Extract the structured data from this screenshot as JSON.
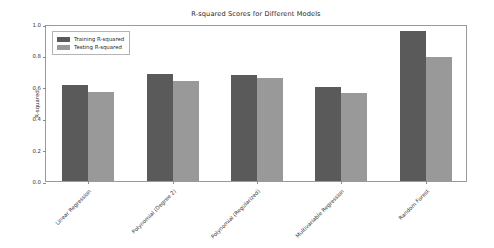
{
  "chart_data": {
    "type": "bar",
    "title": "R-squared Scores for Different Models",
    "xlabel": "",
    "ylabel": "R-squared",
    "categories": [
      "Linear Regression",
      "Polynomial (Degree 2)",
      "Polynomial (Regularized)",
      "Multivariable Regression",
      "Random Forest"
    ],
    "series": [
      {
        "name": "Training R-squared",
        "color": "#5a5a5a",
        "values": [
          0.61,
          0.68,
          0.675,
          0.6,
          0.955
        ]
      },
      {
        "name": "Testing R-squared",
        "color": "#999999",
        "values": [
          0.57,
          0.64,
          0.655,
          0.56,
          0.79
        ]
      }
    ],
    "ylim": [
      0.0,
      1.0
    ],
    "yticks": [
      "0.0",
      "0.2",
      "0.4",
      "0.6",
      "0.8",
      "1.0"
    ],
    "ytick_values": [
      0.0,
      0.2,
      0.4,
      0.6,
      0.8,
      1.0
    ],
    "grid": false,
    "legend_position": "upper left",
    "legend_entries": [
      "Training R-squared",
      "Testing R-squared"
    ]
  }
}
